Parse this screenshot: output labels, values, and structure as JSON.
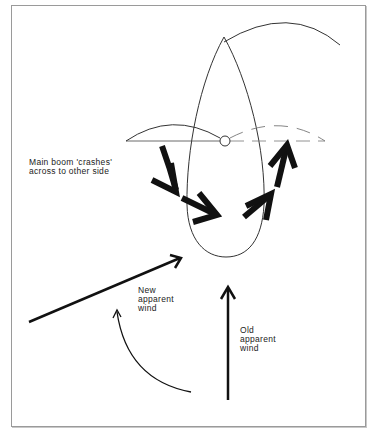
{
  "diagram": {
    "labels": {
      "boom": {
        "line1": "Main boom 'crashes'",
        "line2": "across to other side"
      },
      "new_wind": {
        "line1": "New",
        "line2": "apparent",
        "line3": "wind"
      },
      "old_wind": {
        "line1": "Old",
        "line2": "apparent",
        "line3": "wind"
      }
    },
    "elements": [
      {
        "name": "hull-outline",
        "type": "boat-hull",
        "view": "top-down"
      },
      {
        "name": "mainsail-arc",
        "type": "curve"
      },
      {
        "name": "boom-line",
        "type": "line"
      },
      {
        "name": "mast-pivot",
        "type": "circle"
      },
      {
        "name": "old-boom-arc",
        "type": "solid-arc",
        "side": "left"
      },
      {
        "name": "new-boom-arc",
        "type": "dashed-arc",
        "side": "right"
      },
      {
        "name": "boom-motion-arrows",
        "type": "bold-arrows",
        "count": 4,
        "direction": "left-to-right"
      },
      {
        "name": "new-apparent-wind-arrow",
        "type": "arrow"
      },
      {
        "name": "old-apparent-wind-arrow",
        "type": "arrow"
      },
      {
        "name": "wind-shift-arrow",
        "type": "curved-arrow"
      }
    ],
    "colors": {
      "ink": "#1a1a1a",
      "frame": "#9a9a9a",
      "background": "#ffffff"
    }
  }
}
